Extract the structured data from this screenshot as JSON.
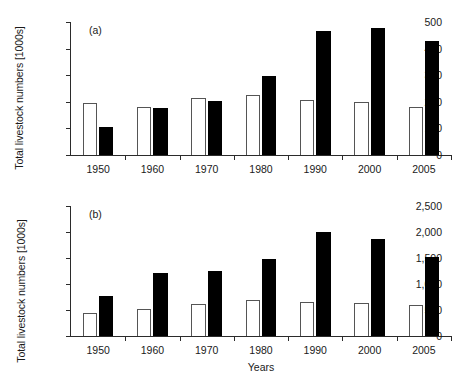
{
  "figure": {
    "width": 463,
    "height": 391,
    "background": "#ffffff",
    "bar_open_color": "#ffffff",
    "bar_open_edge_color": "#555555",
    "bar_filled_color": "#000000",
    "axis_color": "#2b2b2b"
  },
  "chart_data": [
    {
      "type": "bar",
      "panel": "(a)",
      "title": "",
      "xlabel": "",
      "ylabel": "Total livestock numbers [1000s]",
      "categories": [
        "1950",
        "1960",
        "1970",
        "1980",
        "1990",
        "2000",
        "2005"
      ],
      "ytick_labels": [
        "0",
        "100",
        "200",
        "300",
        "400",
        "500"
      ],
      "ytick_values": [
        0,
        100,
        200,
        300,
        400,
        500
      ],
      "ylim": [
        0,
        500
      ],
      "grid": false,
      "legend": "none",
      "series": [
        {
          "name": "open bars",
          "style": "open",
          "values": [
            195,
            182,
            215,
            225,
            207,
            198,
            182
          ]
        },
        {
          "name": "filled bars",
          "style": "filled",
          "values": [
            105,
            178,
            203,
            297,
            468,
            476,
            427
          ]
        }
      ]
    },
    {
      "type": "bar",
      "panel": "(b)",
      "title": "",
      "xlabel": "Years",
      "ylabel": "Total livestock numbers [1000s]",
      "categories": [
        "1950",
        "1960",
        "1970",
        "1980",
        "1990",
        "2000",
        "2005"
      ],
      "ytick_labels": [
        "0",
        "500",
        "1,000",
        "1,500",
        "2,000",
        "2,500"
      ],
      "ytick_values": [
        0,
        500,
        1000,
        1500,
        2000,
        2500
      ],
      "ylim": [
        0,
        2500
      ],
      "grid": false,
      "legend": "none",
      "series": [
        {
          "name": "open bars",
          "style": "open",
          "values": [
            440,
            510,
            610,
            700,
            660,
            630,
            590
          ]
        },
        {
          "name": "filled bars",
          "style": "filled",
          "values": [
            775,
            1215,
            1255,
            1480,
            2000,
            1865,
            1510
          ]
        }
      ]
    }
  ]
}
